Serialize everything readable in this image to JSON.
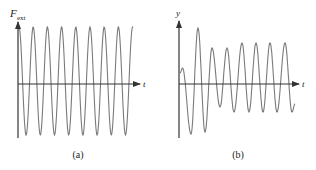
{
  "panels": [
    {
      "id": "a",
      "caption": "(a)",
      "y_axis_label": "F",
      "y_axis_subscript": "ext",
      "x_axis_label": "t",
      "description": "steady sinusoidal external driving force"
    },
    {
      "id": "b",
      "caption": "(b)",
      "y_axis_label": "y",
      "x_axis_label": "t",
      "description": "displacement response: transient beating settling to steady-state oscillation"
    }
  ],
  "colors": {
    "curve": "#7a7a7a",
    "axis": "#333333",
    "text": "#222222"
  }
}
